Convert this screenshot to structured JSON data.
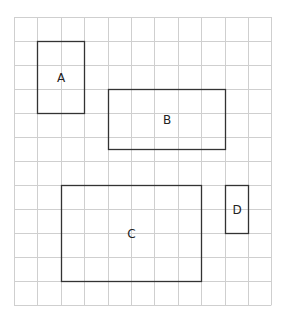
{
  "grid": {
    "origin_x": 14,
    "origin_y": 17,
    "cell_w": 23.4,
    "cell_h": 24,
    "cols": 11,
    "rows": 12,
    "line_color": "#cfcfcf",
    "border_color": "#c8c8c8"
  },
  "shapes": [
    {
      "label": "A",
      "col": 1,
      "row": 1,
      "w": 2,
      "h": 3
    },
    {
      "label": "B",
      "col": 4,
      "row": 3,
      "w": 5,
      "h": 2.5
    },
    {
      "label": "C",
      "col": 2,
      "row": 7,
      "w": 6,
      "h": 4
    },
    {
      "label": "D",
      "col": 9,
      "row": 7,
      "w": 1,
      "h": 2
    }
  ],
  "shape_style": {
    "stroke": "#333333",
    "stroke_width": 1.3
  }
}
